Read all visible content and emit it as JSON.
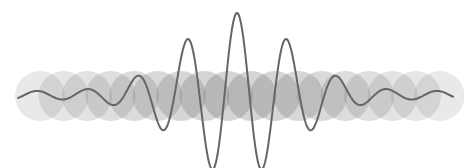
{
  "graphic": {
    "description": "Wave packet illustration with overlapping translucent circles",
    "background": "#ffffff",
    "circle_color": "#808080",
    "wave_color": "#666666",
    "wave_width": 2,
    "baseline_y": 95,
    "circles": {
      "count": 18,
      "start_x": 40,
      "spacing": 23.5,
      "center_y": 96,
      "rx": 25,
      "ry": 25,
      "peak_x": 237,
      "min_opacity": 0.06,
      "max_opacity": 0.34,
      "falloff": 150
    },
    "wave": {
      "x_start": 18,
      "x_end": 453,
      "center_x": 237,
      "amplitude": 78,
      "sigma": 55,
      "wavelength": 50,
      "phase_peak_x": 237,
      "tail_amplitude": 4
    }
  }
}
